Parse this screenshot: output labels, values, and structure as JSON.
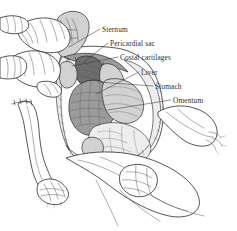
{
  "figure": {
    "medium": "pen-and-ink line drawing",
    "background_color": "#ffffff",
    "ink_color": "#1d1d1d",
    "label_color": "#2b2b2b",
    "width": 237,
    "height": 231
  },
  "labels": [
    {
      "id": "sternum",
      "text": "Sternum",
      "text_x": 102,
      "text_y": 32,
      "leader_start_x": 100,
      "leader_start_y": 29,
      "leader_end_x": 69,
      "leader_end_y": 47
    },
    {
      "id": "pericardial-sac",
      "text": "Pericardial sac",
      "text_x": 110,
      "text_y": 46,
      "leader_start_x": 108,
      "leader_start_y": 43,
      "leader_end_x": 84,
      "leader_end_y": 62
    },
    {
      "id": "costal-cartilages",
      "text": "Costal cartilages",
      "text_x": 120,
      "text_y": 60,
      "leader_start_x": 118,
      "leader_start_y": 57,
      "leader_end_x": 72,
      "leader_end_y": 66
    },
    {
      "id": "liver",
      "text": "Liver",
      "text_x": 141,
      "text_y": 75,
      "leader_start_x": 139,
      "leader_start_y": 72,
      "leader_end_x": 96,
      "leader_end_y": 94
    },
    {
      "id": "stomach",
      "text": "Stomach",
      "text_x": 155,
      "text_y": 89,
      "leader_start_x": 153,
      "leader_start_y": 86,
      "leader_end_x": 98,
      "leader_end_y": 82
    },
    {
      "id": "omentum",
      "text": "Omentum",
      "text_x": 173,
      "text_y": 103,
      "leader_start_x": 171,
      "leader_start_y": 100,
      "leader_end_x": 108,
      "leader_end_y": 110
    }
  ],
  "regions": [
    {
      "id": "hand-upper-left",
      "name": "gloved hand retracting chest wall"
    },
    {
      "id": "hand-mid-left",
      "name": "gloved hand holding flap"
    },
    {
      "id": "limb-lower-left",
      "name": "animal forelimb with paw"
    },
    {
      "id": "limb-right",
      "name": "animal limb at right"
    },
    {
      "id": "limb-lower-right",
      "name": "animal hindlimb with paw"
    },
    {
      "id": "body-cavity",
      "name": "opened thoracic and abdominal cavity"
    }
  ]
}
